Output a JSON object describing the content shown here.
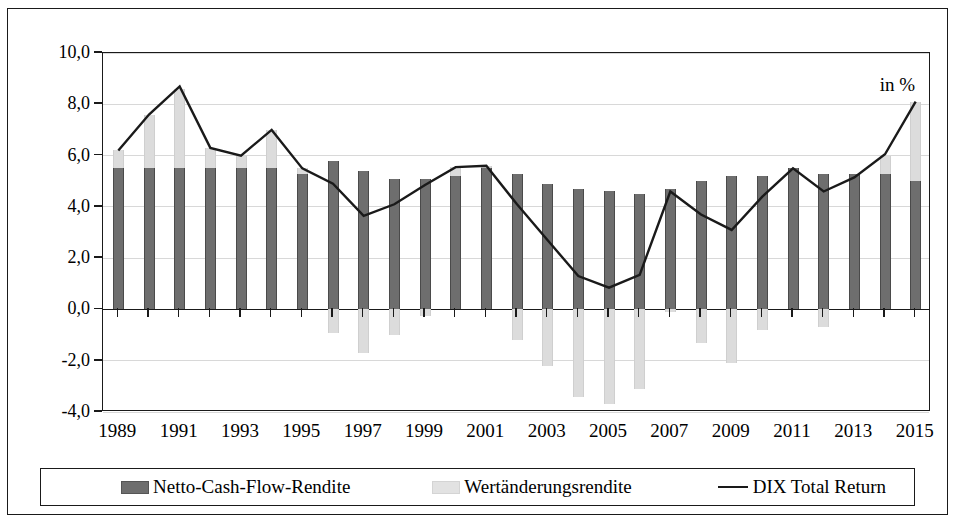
{
  "annotation": {
    "units": "in %"
  },
  "axis": {
    "y_ticks": [
      "10,0",
      "8,0",
      "6,0",
      "4,0",
      "2,0",
      "0,0",
      "-2,0",
      "-4,0"
    ],
    "y_values": [
      10,
      8,
      6,
      4,
      2,
      0,
      -2,
      -4
    ],
    "x_ticks": [
      "1989",
      "1991",
      "1993",
      "1995",
      "1997",
      "1999",
      "2001",
      "2003",
      "2005",
      "2007",
      "2009",
      "2011",
      "2013",
      "2015"
    ]
  },
  "legend": {
    "items": [
      {
        "label": "Netto-Cash-Flow-Rendite",
        "marker": "dark-square",
        "color": "#6e6e6e"
      },
      {
        "label": "Wertänderungsrendite",
        "marker": "light-square",
        "color": "#dcdcdc"
      },
      {
        "label": "DIX Total Return",
        "marker": "line",
        "color": "#1a1a1a"
      }
    ]
  },
  "chart_data": {
    "type": "bar",
    "title": "",
    "subtitle": "",
    "xlabel": "",
    "ylabel": "",
    "unit_annotation": "in %",
    "ylim": [
      -4,
      10
    ],
    "grid": true,
    "legend_position": "bottom",
    "stacked": true,
    "categories": [
      "1989",
      "1990",
      "1991",
      "1992",
      "1993",
      "1994",
      "1995",
      "1996",
      "1997",
      "1998",
      "1999",
      "2000",
      "2001",
      "2002",
      "2003",
      "2004",
      "2005",
      "2006",
      "2007",
      "2008",
      "2009",
      "2010",
      "2011",
      "2012",
      "2013",
      "2014",
      "2015"
    ],
    "series": [
      {
        "name": "Netto-Cash-Flow-Rendite",
        "type": "bar",
        "color": "#6e6e6e",
        "values": [
          5.5,
          5.5,
          5.5,
          5.5,
          5.5,
          5.5,
          5.3,
          5.8,
          5.4,
          5.1,
          5.1,
          5.2,
          5.5,
          5.3,
          4.9,
          4.7,
          4.6,
          4.5,
          4.7,
          5.0,
          5.2,
          5.2,
          5.5,
          5.3,
          5.3,
          5.3,
          5.0
        ]
      },
      {
        "name": "Wertänderungsrendite",
        "type": "bar",
        "color": "#dcdcdc",
        "values": [
          0.7,
          2.1,
          3.1,
          0.8,
          0.5,
          1.5,
          0.2,
          -0.9,
          -1.7,
          -1.0,
          -0.25,
          0.35,
          0.1,
          -1.2,
          -2.2,
          -3.4,
          -3.7,
          -3.1,
          -0.1,
          -1.3,
          -2.1,
          -0.8,
          0.0,
          -0.7,
          0.0,
          0.7,
          3.1
        ]
      },
      {
        "name": "DIX Total Return",
        "type": "line",
        "color": "#1a1a1a",
        "values": [
          6.2,
          7.6,
          8.7,
          6.3,
          6.0,
          7.0,
          5.5,
          4.9,
          3.65,
          4.1,
          4.85,
          5.55,
          5.6,
          4.1,
          2.7,
          1.3,
          0.85,
          1.35,
          4.6,
          3.7,
          3.1,
          4.4,
          5.5,
          4.6,
          5.15,
          6.05,
          8.1
        ]
      }
    ]
  }
}
